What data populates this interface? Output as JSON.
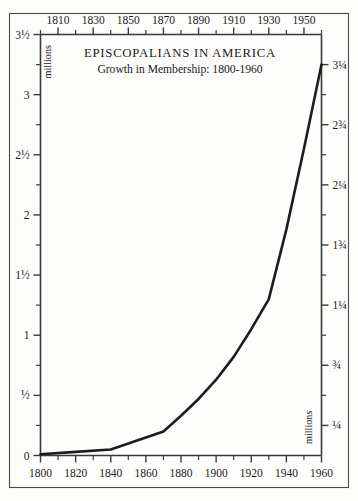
{
  "chart_data": {
    "type": "line",
    "title": "EPISCOPALIANS IN AMERICA",
    "subtitle": "Growth in Membership: 1800-1960",
    "xlabel": "",
    "ylabel": "millions",
    "ylabel_right": "millions",
    "xlim": [
      1800,
      1960
    ],
    "ylim": [
      0,
      3.5
    ],
    "grid": false,
    "legend": "none",
    "x": [
      1800,
      1820,
      1840,
      1870,
      1880,
      1890,
      1900,
      1910,
      1920,
      1930,
      1940,
      1950,
      1960
    ],
    "values": [
      0.01,
      0.03,
      0.05,
      0.2,
      0.33,
      0.47,
      0.63,
      0.82,
      1.05,
      1.3,
      1.88,
      2.55,
      3.25
    ],
    "series": [
      {
        "name": "Episcopalian membership",
        "values": [
          0.01,
          0.03,
          0.05,
          0.2,
          0.33,
          0.47,
          0.63,
          0.82,
          1.05,
          1.3,
          1.88,
          2.55,
          3.25
        ]
      }
    ],
    "x_axis_bottom": {
      "ticks": [
        1800,
        1820,
        1840,
        1860,
        1880,
        1900,
        1920,
        1940,
        1960
      ],
      "labels": [
        "1800",
        "1820",
        "1840",
        "1860",
        "1880",
        "1900",
        "1920",
        "1940",
        "1960"
      ],
      "minor_step": 10
    },
    "x_axis_top": {
      "ticks": [
        1810,
        1830,
        1850,
        1870,
        1890,
        1910,
        1930,
        1950
      ],
      "labels": [
        "1810",
        "1830",
        "1850",
        "1870",
        "1890",
        "1910",
        "1930",
        "1950"
      ],
      "minor_step": 10
    },
    "y_axis_left": {
      "ticks": [
        0,
        0.5,
        1,
        1.5,
        2,
        2.5,
        3,
        3.5
      ],
      "labels": [
        "0",
        "½",
        "1",
        "1½",
        "2",
        "2½",
        "3",
        "3½"
      ],
      "minor_ticks": [
        0.25,
        0.75,
        1.25,
        1.75,
        2.25,
        2.75,
        3.25
      ],
      "unit": "millions"
    },
    "y_axis_right": {
      "ticks": [
        0.25,
        0.75,
        1.25,
        1.75,
        2.25,
        2.75,
        3.25
      ],
      "labels": [
        "¼",
        "¾",
        "1¼",
        "1¾",
        "2¼",
        "2¾",
        "3¼"
      ],
      "minor_ticks": [
        0.5,
        1,
        1.5,
        2,
        2.5,
        3
      ],
      "unit": "millions"
    },
    "colors": {
      "line": "#1d1d1d",
      "axis": "#3a3a3a",
      "frame": "#4a4a4a",
      "background": "#fdfdfc",
      "text": "#1a1a1a"
    }
  }
}
